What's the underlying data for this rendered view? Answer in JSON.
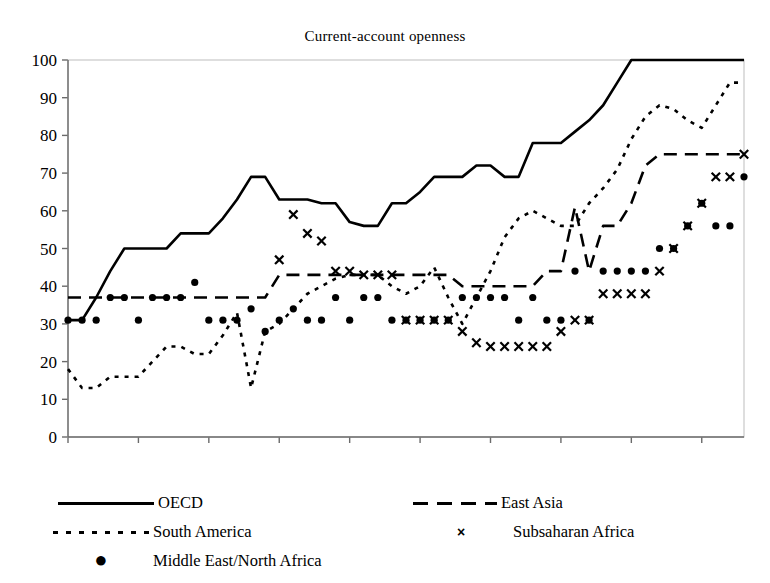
{
  "chart": {
    "title": "Current-account openness",
    "xlabel": "",
    "ylabel": ""
  },
  "axis": {
    "y_ticks": [
      "0",
      "10",
      "20",
      "30",
      "40",
      "50",
      "60",
      "70",
      "80",
      "90",
      "100"
    ],
    "x_ticks": [
      "1950",
      "1955",
      "1960",
      "1965",
      "1970",
      "1975",
      "1980",
      "1985",
      "1990",
      "1995"
    ]
  },
  "legend": {
    "oecd": "OECD",
    "east_asia": "East Asia",
    "south_america": "South America",
    "subsaharan_africa": "Subsaharan Africa",
    "middle_east_north_africa": "Middle East/North Africa",
    "marker_x": "×",
    "marker_dot": "●"
  },
  "chart_data": {
    "type": "line",
    "title": "Current-account openness",
    "xlabel": "",
    "ylabel": "",
    "xlim": [
      1950,
      1998
    ],
    "ylim": [
      0,
      100
    ],
    "grid": false,
    "legend_position": "below",
    "x": [
      1950,
      1951,
      1952,
      1953,
      1954,
      1955,
      1956,
      1957,
      1958,
      1959,
      1960,
      1961,
      1962,
      1963,
      1964,
      1965,
      1966,
      1967,
      1968,
      1969,
      1970,
      1971,
      1972,
      1973,
      1974,
      1975,
      1976,
      1977,
      1978,
      1979,
      1980,
      1981,
      1982,
      1983,
      1984,
      1985,
      1986,
      1987,
      1988,
      1989,
      1990,
      1991,
      1992,
      1993,
      1994,
      1995,
      1996,
      1997,
      1998
    ],
    "series": [
      {
        "name": "OECD",
        "style": "solid",
        "values": [
          31,
          31,
          37,
          44,
          50,
          50,
          50,
          50,
          54,
          54,
          54,
          58,
          63,
          69,
          69,
          63,
          63,
          63,
          62,
          62,
          57,
          56,
          56,
          62,
          62,
          65,
          69,
          69,
          69,
          72,
          72,
          69,
          69,
          78,
          78,
          78,
          81,
          84,
          88,
          94,
          100,
          100,
          100,
          100,
          100,
          100,
          100,
          100,
          100
        ]
      },
      {
        "name": "East Asia",
        "style": "dashed",
        "values": [
          37,
          37,
          37,
          37,
          37,
          37,
          37,
          37,
          37,
          37,
          37,
          37,
          37,
          37,
          37,
          43,
          43,
          43,
          43,
          43,
          43,
          43,
          43,
          43,
          43,
          43,
          43,
          43,
          40,
          40,
          40,
          40,
          40,
          40,
          44,
          44,
          61,
          44,
          56,
          56,
          62,
          72,
          75,
          75,
          75,
          75,
          75,
          75,
          75
        ]
      },
      {
        "name": "South America",
        "style": "dotted",
        "values": [
          18,
          13,
          13,
          16,
          16,
          16,
          20,
          24,
          24,
          22,
          22,
          27,
          33,
          13,
          28,
          30,
          34,
          38,
          40,
          42,
          43,
          43,
          43,
          40,
          38,
          40,
          45,
          37,
          30,
          37,
          44,
          53,
          58,
          60,
          58,
          56,
          56,
          62,
          66,
          71,
          79,
          85,
          88,
          87,
          84,
          82,
          88,
          94,
          94
        ]
      },
      {
        "name": "Subsaharan Africa",
        "style": "markers-x",
        "values": [
          null,
          null,
          null,
          null,
          null,
          null,
          null,
          null,
          null,
          null,
          null,
          null,
          null,
          null,
          null,
          47,
          59,
          54,
          52,
          44,
          44,
          43,
          43,
          43,
          31,
          31,
          31,
          31,
          28,
          25,
          24,
          24,
          24,
          24,
          24,
          28,
          31,
          31,
          38,
          38,
          38,
          38,
          44,
          50,
          56,
          62,
          69,
          69,
          75
        ]
      },
      {
        "name": "Middle East/North Africa",
        "style": "markers-dot",
        "values": [
          31,
          31,
          31,
          37,
          37,
          31,
          37,
          37,
          37,
          41,
          31,
          31,
          31,
          34,
          28,
          31,
          34,
          31,
          31,
          37,
          31,
          37,
          37,
          31,
          31,
          31,
          31,
          31,
          37,
          37,
          37,
          37,
          31,
          37,
          31,
          31,
          44,
          31,
          44,
          44,
          44,
          44,
          50,
          50,
          56,
          62,
          56,
          56,
          69
        ]
      }
    ]
  }
}
